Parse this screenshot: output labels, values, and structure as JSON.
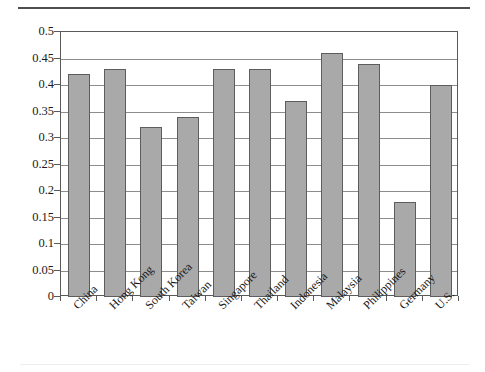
{
  "chart_data": {
    "type": "bar",
    "title": "",
    "subtitle": "",
    "xlabel": "",
    "ylabel": "",
    "categories": [
      "China",
      "Hong Kong",
      "South Korea",
      "Taiwan",
      "Singapore",
      "Thailand",
      "Indonesia",
      "Malaysia",
      "Philippines",
      "Germany",
      "U.S."
    ],
    "values": [
      0.42,
      0.43,
      0.32,
      0.34,
      0.43,
      0.43,
      0.37,
      0.46,
      0.44,
      0.18,
      0.4
    ],
    "ylim": [
      0,
      0.5
    ],
    "ytick_values": [
      0,
      0.05,
      0.1,
      0.15,
      0.2,
      0.25,
      0.3,
      0.35,
      0.4,
      0.45,
      0.5
    ],
    "ytick_labels": [
      "0",
      "0.05",
      "0.1",
      "0.15",
      "0.2",
      "0.25",
      "0.3",
      "0.35",
      "0.4",
      "0.45",
      "0.5"
    ],
    "grid": true,
    "grid_axis": "y",
    "legend": false,
    "legend_position": "none",
    "bar_color": "#a9a9a9",
    "bar_edge_color": "#5d5d5d",
    "axis_color": "#5a5a5a",
    "gridline_color": "#8d8d8d",
    "xtick_label_rotation": -45
  }
}
